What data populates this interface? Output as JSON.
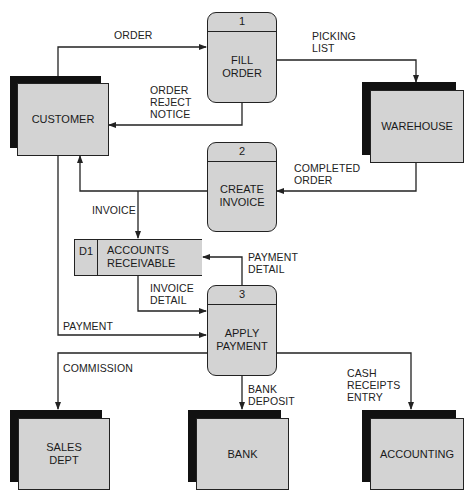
{
  "diagram": {
    "type": "data-flow-diagram",
    "external_entities": [
      {
        "id": "customer",
        "label": "CUSTOMER"
      },
      {
        "id": "warehouse",
        "label": "WAREHOUSE"
      },
      {
        "id": "sales_dept",
        "label": "SALES\nDEPT"
      },
      {
        "id": "bank",
        "label": "BANK"
      },
      {
        "id": "accounting",
        "label": "ACCOUNTING"
      }
    ],
    "processes": [
      {
        "id": "p1",
        "number": "1",
        "label": "FILL\nORDER"
      },
      {
        "id": "p2",
        "number": "2",
        "label": "CREATE\nINVOICE"
      },
      {
        "id": "p3",
        "number": "3",
        "label": "APPLY\nPAYMENT"
      }
    ],
    "data_stores": [
      {
        "id": "d1",
        "number": "D1",
        "label": "ACCOUNTS\nRECEIVABLE"
      }
    ],
    "flows": [
      {
        "id": "order",
        "label": "ORDER",
        "from": "customer",
        "to": "p1"
      },
      {
        "id": "picking_list",
        "label": "PICKING\nLIST",
        "from": "p1",
        "to": "warehouse"
      },
      {
        "id": "order_reject_notice",
        "label": "ORDER\nREJECT\nNOTICE",
        "from": "p1",
        "to": "customer"
      },
      {
        "id": "completed_order",
        "label": "COMPLETED\nORDER",
        "from": "warehouse",
        "to": "p2"
      },
      {
        "id": "invoice",
        "label": "INVOICE",
        "from": "p2",
        "to": "customer, d1"
      },
      {
        "id": "payment_detail",
        "label": "PAYMENT\nDETAIL",
        "from": "p3",
        "to": "d1"
      },
      {
        "id": "invoice_detail",
        "label": "INVOICE\nDETAIL",
        "from": "d1",
        "to": "p3"
      },
      {
        "id": "payment",
        "label": "PAYMENT",
        "from": "customer",
        "to": "p3"
      },
      {
        "id": "commission",
        "label": "COMMISSION",
        "from": "p3",
        "to": "sales_dept"
      },
      {
        "id": "bank_deposit",
        "label": "BANK\nDEPOSIT",
        "from": "p3",
        "to": "bank"
      },
      {
        "id": "cash_receipts_entry",
        "label": "CASH\nRECEIPTS\nENTRY",
        "from": "p3",
        "to": "accounting"
      }
    ]
  },
  "colors": {
    "fill": "#d3d3d3",
    "shadow": "#111111",
    "line": "#222222",
    "background": "#ffffff"
  }
}
